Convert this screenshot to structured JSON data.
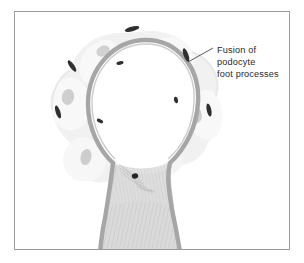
{
  "figure": {
    "kind": "histology-diagram",
    "background_color": "#ffffff",
    "frame": {
      "name": "figure-border",
      "color": "#9a9a9a",
      "x": 14,
      "y": 11,
      "width": 276,
      "height": 239
    }
  },
  "annotation": {
    "label_lines": [
      "Fusion of",
      "podocyte",
      "foot processes"
    ],
    "line1": "Fusion of",
    "line2": "podocyte",
    "line3": "foot processes",
    "text_color": "#2b2b2b",
    "leader_line_color": "#4a4a4a",
    "points_to": "fused-foot-process-marker"
  },
  "colors": {
    "basement_membrane": "#a6a6a6",
    "cell_body_pale": "#f0f0f0",
    "lobe_light": "#f6f6f6",
    "lobe_shadow": "#e6e6e6",
    "nucleus_gray": "#cfcfcf",
    "foot_process_dark": "#2f2f2f",
    "capillary_lumen": "#ffffff",
    "stalk_fill": "#d8d8d8",
    "stalk_hatch": "#bdbdbd",
    "mesangial_nucleus": "#1f1f1f"
  },
  "structures": {
    "capillary_loop": {
      "name": "capillary-loop",
      "lumen_color": "#ffffff",
      "membrane_color": "#a6a6a6",
      "membrane_width": 4.5
    },
    "podocyte_cell_body": {
      "name": "podocyte-cell-body",
      "fill": "#f0f0f0"
    },
    "foot_process_markers": [
      {
        "cx": 132,
        "cy": 29,
        "rx": 7.5,
        "ry": 2.4,
        "rot": -14
      },
      {
        "cx": 186,
        "cy": 55,
        "rx": 7.0,
        "ry": 2.4,
        "rot": 70
      },
      {
        "cx": 72,
        "cy": 66,
        "rx": 6.8,
        "ry": 2.3,
        "rot": 55
      },
      {
        "cx": 58,
        "cy": 112,
        "rx": 6.8,
        "ry": 2.3,
        "rot": 72
      },
      {
        "cx": 209,
        "cy": 110,
        "rx": 6.6,
        "ry": 2.3,
        "rot": 78
      },
      {
        "cx": 120,
        "cy": 63,
        "rx": 3.6,
        "ry": 1.8,
        "rot": -10
      },
      {
        "cx": 100,
        "cy": 121,
        "rx": 3.4,
        "ry": 1.8,
        "rot": 28
      },
      {
        "cx": 176,
        "cy": 100,
        "rx": 3.2,
        "ry": 2.0,
        "rot": 80
      }
    ],
    "podocyte_nuclei": [
      {
        "cx": 103,
        "cy": 51,
        "rx": 7.0,
        "ry": 5.2,
        "rot": -28
      },
      {
        "cx": 173,
        "cy": 56,
        "rx": 7.6,
        "ry": 5.4,
        "rot": 30
      },
      {
        "cx": 68,
        "cy": 97,
        "rx": 6.2,
        "ry": 8.0,
        "rot": 10
      },
      {
        "cx": 196,
        "cy": 115,
        "rx": 5.8,
        "ry": 8.4,
        "rot": -8
      },
      {
        "cx": 142,
        "cy": 113,
        "rx": 6.6,
        "ry": 5.0,
        "rot": 15
      },
      {
        "cx": 86,
        "cy": 157,
        "rx": 5.4,
        "ry": 8.2,
        "rot": 12
      }
    ],
    "mesangial_cell": {
      "name": "mesangial-cell",
      "nucleus_cx": 135,
      "nucleus_cy": 176,
      "nucleus_rx": 3.2,
      "nucleus_ry": 2.6
    }
  }
}
